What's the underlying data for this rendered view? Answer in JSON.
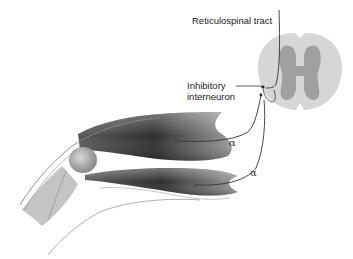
{
  "diagram": {
    "type": "anatomical illustration",
    "labels": {
      "reticulospinal_tract": "Reticulospinal tract",
      "inhibitory_interneuron_line1": "Inhibitory",
      "inhibitory_interneuron_line2": "interneuron",
      "alpha_upper": "α",
      "alpha_lower": "α"
    },
    "structures": [
      "spinal cord cross-section",
      "grey matter",
      "white matter",
      "upper limb muscle (flexor)",
      "lower limb muscle (extensor)",
      "knee joint",
      "skin outline"
    ],
    "colors": {
      "white_matter": "#d6d6d6",
      "grey_matter": "#9a9a9a",
      "muscle_dark": "#3a3a3a",
      "nerve_line": "#333333"
    }
  }
}
